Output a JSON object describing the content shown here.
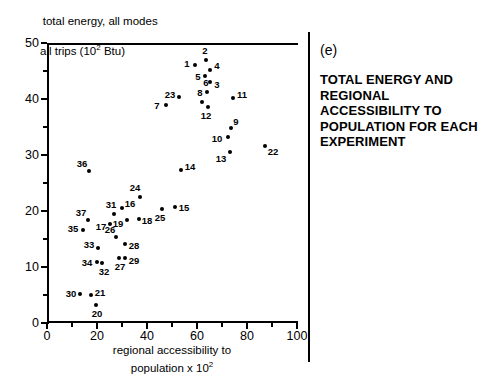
{
  "figure": {
    "panel_letter": "(e)",
    "title": "TOTAL ENERGY AND REGIONAL ACCESSIBILITY TO POPULATION FOR EACH EXPERIMENT",
    "y_caption_line1": "total energy, all modes",
    "y_caption_line2": "all trips (10",
    "y_caption_exp": "2",
    "y_caption_line2b": " Btu)",
    "x_caption_line1": "regional accessibility to",
    "x_caption_line2": "population x 10",
    "x_caption_exp": "2"
  },
  "chart_data": {
    "type": "scatter",
    "title": "TOTAL ENERGY AND REGIONAL ACCESSIBILITY TO POPULATION FOR EACH EXPERIMENT",
    "xlabel": "regional accessibility to population x 10^2",
    "ylabel": "total energy, all modes all trips (10^2 Btu)",
    "xlim": [
      0,
      100
    ],
    "ylim": [
      0,
      50
    ],
    "x_ticks": [
      0,
      20,
      40,
      60,
      80,
      100
    ],
    "x_minor_ticks": [
      10,
      30,
      50,
      70,
      90
    ],
    "y_ticks": [
      0,
      10,
      20,
      30,
      40,
      50
    ],
    "y_minor_ticks": [
      5,
      15,
      25,
      35,
      45
    ],
    "grid": false,
    "legend": "none",
    "point_label_field": "experiment number",
    "points": [
      {
        "label": "1",
        "x": 59.2,
        "y": 46.1,
        "lx": -8,
        "ly": -1
      },
      {
        "label": "2",
        "x": 63.6,
        "y": 47.0,
        "lx": -1,
        "ly": -9
      },
      {
        "label": "3",
        "x": 65.2,
        "y": 43.0,
        "lx": 7,
        "ly": 3
      },
      {
        "label": "4",
        "x": 65.2,
        "y": 45.2,
        "lx": 7,
        "ly": -4
      },
      {
        "label": "5",
        "x": 63.2,
        "y": 44.1,
        "lx": -7,
        "ly": 1
      },
      {
        "label": "6",
        "x": 64.0,
        "y": 41.2,
        "lx": -1,
        "ly": -9
      },
      {
        "label": "7",
        "x": 47.6,
        "y": 38.9,
        "lx": -9,
        "ly": 1
      },
      {
        "label": "8",
        "x": 62.0,
        "y": 39.5,
        "lx": -2,
        "ly": -9
      },
      {
        "label": "9",
        "x": 73.6,
        "y": 34.8,
        "lx": 5,
        "ly": -6
      },
      {
        "label": "10",
        "x": 72.4,
        "y": 33.2,
        "lx": -11,
        "ly": 2
      },
      {
        "label": "11",
        "x": 74.4,
        "y": 40.2,
        "lx": 9,
        "ly": -3
      },
      {
        "label": "12",
        "x": 64.4,
        "y": 38.6,
        "lx": -2,
        "ly": 9
      },
      {
        "label": "13",
        "x": 73.2,
        "y": 30.5,
        "lx": -9,
        "ly": 7
      },
      {
        "label": "14",
        "x": 53.6,
        "y": 27.3,
        "lx": 9,
        "ly": -3
      },
      {
        "label": "15",
        "x": 51.2,
        "y": 20.7,
        "lx": 9,
        "ly": 1
      },
      {
        "label": "16",
        "x": 30.0,
        "y": 20.5,
        "lx": 8,
        "ly": -4
      },
      {
        "label": "17",
        "x": 25.2,
        "y": 17.7,
        "lx": -9,
        "ly": 3
      },
      {
        "label": "18",
        "x": 36.8,
        "y": 18.6,
        "lx": 8,
        "ly": 2
      },
      {
        "label": "19",
        "x": 32.0,
        "y": 18.4,
        "lx": -9,
        "ly": 4
      },
      {
        "label": "20",
        "x": 19.6,
        "y": 3.2,
        "lx": 1,
        "ly": 9
      },
      {
        "label": "21",
        "x": 17.6,
        "y": 5.0,
        "lx": 9,
        "ly": -2
      },
      {
        "label": "22",
        "x": 87.2,
        "y": 31.6,
        "lx": 8,
        "ly": 6
      },
      {
        "label": "23",
        "x": 52.8,
        "y": 40.4,
        "lx": -9,
        "ly": -2
      },
      {
        "label": "24",
        "x": 37.2,
        "y": 22.5,
        "lx": -5,
        "ly": -9
      },
      {
        "label": "25",
        "x": 46.0,
        "y": 20.4,
        "lx": -2,
        "ly": 9
      },
      {
        "label": "26",
        "x": 27.6,
        "y": 15.4,
        "lx": -6,
        "ly": -7
      },
      {
        "label": "27",
        "x": 28.8,
        "y": 11.6,
        "lx": 1,
        "ly": 9
      },
      {
        "label": "28",
        "x": 31.2,
        "y": 14.1,
        "lx": 9,
        "ly": 2
      },
      {
        "label": "29",
        "x": 31.2,
        "y": 11.6,
        "lx": 9,
        "ly": 3
      },
      {
        "label": "30",
        "x": 13.2,
        "y": 5.2,
        "lx": -9,
        "ly": 0
      },
      {
        "label": "31",
        "x": 26.8,
        "y": 19.5,
        "lx": -3,
        "ly": -9
      },
      {
        "label": "32",
        "x": 22.0,
        "y": 10.8,
        "lx": 2,
        "ly": 9
      },
      {
        "label": "33",
        "x": 20.4,
        "y": 13.4,
        "lx": -9,
        "ly": -3
      },
      {
        "label": "34",
        "x": 20.0,
        "y": 10.9,
        "lx": -10,
        "ly": 1
      },
      {
        "label": "35",
        "x": 14.4,
        "y": 16.6,
        "lx": -10,
        "ly": -1
      },
      {
        "label": "36",
        "x": 16.8,
        "y": 27.1,
        "lx": -7,
        "ly": -7
      },
      {
        "label": "37",
        "x": 16.4,
        "y": 18.4,
        "lx": -7,
        "ly": -7
      }
    ]
  }
}
